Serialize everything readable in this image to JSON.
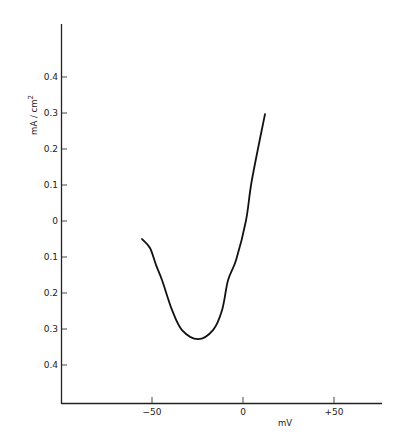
{
  "chart_data": {
    "type": "line",
    "title": "",
    "xlabel": "mV",
    "ylabel": "mA / cm2",
    "ylabel_display": "mA / cm",
    "ylabel_superscript": "2",
    "xlim": [
      -100,
      77
    ],
    "ylim": [
      -0.5,
      0.55
    ],
    "grid": false,
    "legend": null,
    "x_ticks": [
      {
        "value": -50,
        "label": "−50"
      },
      {
        "value": 0,
        "label": "0"
      },
      {
        "value": 50,
        "label": "+50"
      }
    ],
    "y_ticks": [
      {
        "value": 0.4,
        "label": "0.4"
      },
      {
        "value": 0.3,
        "label": "0.3"
      },
      {
        "value": 0.2,
        "label": "0.2"
      },
      {
        "value": 0.1,
        "label": "0.1"
      },
      {
        "value": 0,
        "label": "0"
      },
      {
        "value": -0.1,
        "label": "0.1"
      },
      {
        "value": -0.2,
        "label": "0.2"
      },
      {
        "value": -0.3,
        "label": "0.3"
      },
      {
        "value": -0.4,
        "label": "0.4"
      }
    ],
    "series": [
      {
        "name": "current-voltage curve",
        "color": "#111111",
        "x": [
          -55.5,
          -51.1,
          -47.8,
          -44.5,
          -39.0,
          -33.5,
          -24.7,
          -16.5,
          -11.5,
          -8.2,
          -3.8,
          1.6,
          4.9,
          12.1
        ],
        "y": [
          -0.05,
          -0.075,
          -0.122,
          -0.164,
          -0.247,
          -0.303,
          -0.328,
          -0.303,
          -0.247,
          -0.164,
          -0.108,
          0.0,
          0.114,
          0.297
        ]
      }
    ]
  }
}
